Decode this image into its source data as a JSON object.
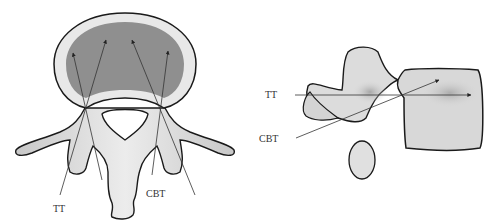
{
  "figure": {
    "panels": [
      {
        "name": "axial-view",
        "labels": {
          "tt": "TT",
          "cbt": "CBT"
        }
      },
      {
        "name": "lateral-view",
        "labels": {
          "tt": "TT",
          "cbt": "CBT"
        }
      }
    ],
    "colors": {
      "outline": "#1a1a1a",
      "bone_fill": "#d9d9d9",
      "cancellous_fill": "#8c8c8c",
      "cortex_fill": "#e6e6e6",
      "trajectory_line": "#444444"
    }
  }
}
